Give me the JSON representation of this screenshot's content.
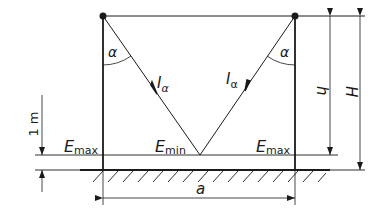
{
  "diagram": {
    "type": "lighting-geometry",
    "colors": {
      "line": "#1a1a1a",
      "background": "#ffffff"
    },
    "labels": {
      "angle_left": "α",
      "angle_right": "α",
      "intensity_left": "I",
      "intensity_left_sub": "α",
      "intensity_right": "I",
      "intensity_right_sub": "α",
      "e_max_left": "E",
      "e_max_left_sub": "max",
      "e_min": "E",
      "e_min_sub": "min",
      "e_max_right": "E",
      "e_max_right_sub": "max",
      "dim_spacing": "a",
      "dim_height_h": "h",
      "dim_height_H": "H",
      "dim_working_plane": "1 m"
    },
    "elements": {
      "luminaires": [
        "left-luminaire",
        "right-luminaire"
      ],
      "poles": [
        "left-pole",
        "right-pole"
      ],
      "planes": [
        "working-plane",
        "ground-plane"
      ]
    }
  }
}
